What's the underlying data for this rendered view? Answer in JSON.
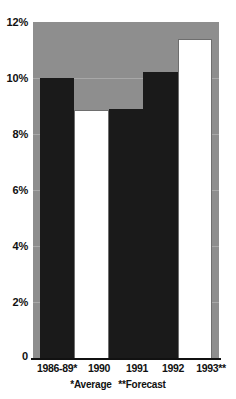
{
  "chart_data": {
    "type": "bar",
    "title": "",
    "subtitle": "",
    "xlabel": "",
    "ylabel": "",
    "categories": [
      "1986-89*",
      "1990",
      "1991",
      "1992",
      "1993**"
    ],
    "values": [
      10.0,
      8.85,
      8.9,
      10.2,
      11.4
    ],
    "value_unit": "%",
    "ylim": [
      0,
      12
    ],
    "ytick_labels": [
      "0",
      "2%",
      "4%",
      "6%",
      "8%",
      "10%",
      "12%"
    ],
    "ytick_values": [
      0,
      2,
      4,
      6,
      8,
      10,
      12
    ],
    "grid": true,
    "legend": "none",
    "bar_styles": [
      "dark",
      "light",
      "dark",
      "dark",
      "light"
    ],
    "annotations": [
      "*Average",
      "**Forecast"
    ],
    "colors": {
      "panel_background": "#8e8e8e",
      "gridline": "#a8a8a8",
      "bar_dark": "#1a1a1a",
      "bar_light": "#ffffff",
      "axis": "#111111",
      "text": "#111111",
      "page_background": "#ffffff"
    }
  },
  "footnote": {
    "average_note": "*Average",
    "forecast_note": "**Forecast"
  }
}
